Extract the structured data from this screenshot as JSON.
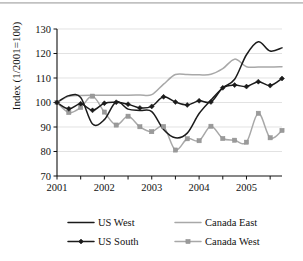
{
  "chart_data": {
    "type": "line",
    "title": "",
    "xlabel": "",
    "ylabel": "Index (1/2001=100)",
    "ylim": [
      70,
      130
    ],
    "yticks": [
      70,
      80,
      90,
      100,
      110,
      120,
      130
    ],
    "xlim": [
      2001.0,
      2005.75
    ],
    "xticks": [
      2001,
      2002,
      2003,
      2004,
      2005
    ],
    "xticklabels": [
      "2001",
      "2002",
      "2003",
      "2004",
      "2005"
    ],
    "minor_xticks": [
      2001.5,
      2002.5,
      2003.5,
      2004.5,
      2005.5
    ],
    "grid": "horizontal",
    "legend_position": "bottom",
    "x": [
      2001.0,
      2001.25,
      2001.5,
      2001.75,
      2002.0,
      2002.25,
      2002.5,
      2002.75,
      2003.0,
      2003.25,
      2003.5,
      2003.75,
      2004.0,
      2004.25,
      2004.5,
      2004.75,
      2005.0,
      2005.25,
      2005.5,
      2005.75
    ],
    "series": [
      {
        "name": "US West",
        "color": "#1b1b1b",
        "style": "line",
        "marker": "none",
        "values": [
          100.0,
          102.8,
          102.0,
          91.2,
          93.0,
          100.3,
          97.3,
          96.7,
          96.3,
          89.0,
          85.6,
          87.5,
          95.5,
          101.0,
          106.0,
          109.5,
          119.5,
          124.8,
          121.0,
          122.3
        ]
      },
      {
        "name": "Canada East",
        "color": "#a8a8a8",
        "style": "line",
        "marker": "none",
        "values": [
          100.0,
          102.5,
          102.9,
          103.0,
          103.0,
          103.0,
          103.0,
          103.1,
          103.2,
          107.5,
          111.4,
          111.4,
          111.3,
          111.5,
          113.8,
          117.7,
          114.6,
          114.5,
          114.5,
          114.6
        ]
      },
      {
        "name": "US South",
        "color": "#1b1b1b",
        "style": "line-marker",
        "marker": "diamond",
        "values": [
          100.0,
          97.4,
          99.5,
          96.8,
          99.7,
          100.1,
          99.3,
          97.8,
          98.4,
          102.3,
          100.2,
          99.0,
          100.7,
          100.2,
          106.0,
          107.1,
          106.5,
          108.5,
          106.9,
          109.8
        ]
      },
      {
        "name": "Canada West",
        "color": "#9a9a9a",
        "style": "line-marker",
        "marker": "square",
        "values": [
          100.0,
          95.9,
          98.0,
          102.6,
          96.1,
          90.8,
          94.4,
          90.1,
          88.1,
          90.2,
          80.6,
          85.2,
          84.4,
          90.3,
          85.3,
          84.6,
          83.8,
          95.6,
          85.6,
          88.6
        ]
      }
    ]
  },
  "legend": {
    "items": [
      {
        "label": "US West",
        "color": "#1b1b1b",
        "marker": "none"
      },
      {
        "label": "Canada East",
        "color": "#a8a8a8",
        "marker": "none"
      },
      {
        "label": "US South",
        "color": "#1b1b1b",
        "marker": "diamond"
      },
      {
        "label": "Canada West",
        "color": "#9a9a9a",
        "marker": "square"
      }
    ]
  }
}
